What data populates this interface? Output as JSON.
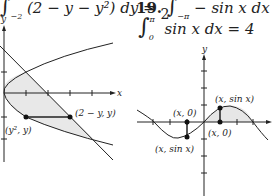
{
  "top_left_equation": "∫₋₂ (2 − y − y²) dy = 9/2",
  "top_right_equation_partial": "19. ∫₋π⁰ − sin x dx +",
  "top_right_equation": "∫₀^π sin x dx = 4",
  "left_figure": {
    "axis_y": "y",
    "axis_x": "x",
    "labels": {
      "right_point": "(2 − y, y)",
      "left_point": "(y², y)"
    }
  },
  "right_figure": {
    "axis_y": "y",
    "labels": {
      "top_right": "(x, sin x)",
      "top_left": "(x, 0)",
      "bottom_right": "(x, 0)",
      "bottom_left": "(x, sin x)"
    }
  }
}
